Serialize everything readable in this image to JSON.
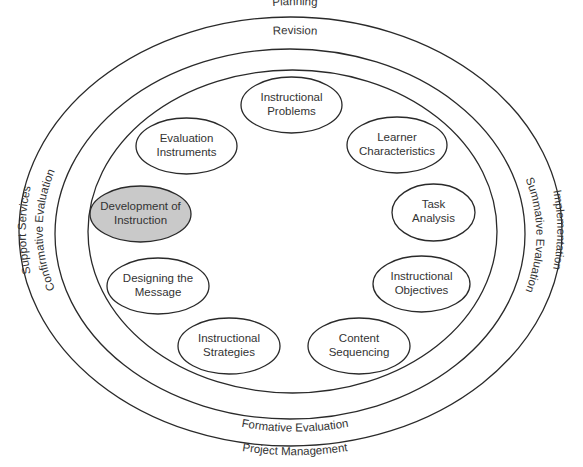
{
  "diagram": {
    "type": "concentric-ellipse-model",
    "colors": {
      "stroke": "#2a2a2a",
      "text": "#333333",
      "highlight_fill": "#c9c9c9",
      "background": "#ffffff"
    },
    "outer_ring": {
      "top": "Planning",
      "bottom": "Project Management",
      "left": "Support Services",
      "right": "Implementation"
    },
    "middle_ring": {
      "top": "Revision",
      "bottom": "Formative Evaluation",
      "left": "Confirmative Evaluation",
      "right": "Summative Evaluation"
    },
    "nodes": [
      {
        "line1": "Instructional",
        "line2": "Problems",
        "highlighted": false
      },
      {
        "line1": "Learner",
        "line2": "Characteristics",
        "highlighted": false
      },
      {
        "line1": "Task",
        "line2": "Analysis",
        "highlighted": false
      },
      {
        "line1": "Instructional",
        "line2": "Objectives",
        "highlighted": false
      },
      {
        "line1": "Content",
        "line2": "Sequencing",
        "highlighted": false
      },
      {
        "line1": "Instructional",
        "line2": "Strategies",
        "highlighted": false
      },
      {
        "line1": "Designing the",
        "line2": "Message",
        "highlighted": false
      },
      {
        "line1": "Development of",
        "line2": "Instruction",
        "highlighted": true
      },
      {
        "line1": "Evaluation",
        "line2": "Instruments",
        "highlighted": false
      }
    ]
  }
}
